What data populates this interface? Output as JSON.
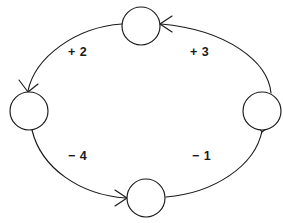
{
  "diagram": {
    "type": "directed-cycle-graph",
    "background_color": "#ffffff",
    "stroke_color": "#1a1a1a",
    "nodes": [
      {
        "id": "top",
        "label": "",
        "cx": 141,
        "cy": 26,
        "r": 19
      },
      {
        "id": "left",
        "label": "",
        "cx": 29,
        "cy": 111,
        "r": 19
      },
      {
        "id": "bottom",
        "label": "",
        "cx": 146,
        "cy": 198,
        "r": 19
      },
      {
        "id": "right",
        "label": "",
        "cx": 262,
        "cy": 111,
        "r": 19
      }
    ],
    "edges": [
      {
        "id": "top-to-left",
        "from": "top",
        "to": "left",
        "label": "+ 2",
        "label_x": 68,
        "label_y": 46
      },
      {
        "id": "left-to-bottom",
        "from": "left",
        "to": "bottom",
        "label": "− 4",
        "label_x": 68,
        "label_y": 150
      },
      {
        "id": "bottom-to-right",
        "from": "bottom",
        "to": "right",
        "label": "− 1",
        "label_x": 192,
        "label_y": 150
      },
      {
        "id": "right-to-top",
        "from": "right",
        "to": "top",
        "label": "+ 3",
        "label_x": 190,
        "label_y": 46
      }
    ]
  }
}
